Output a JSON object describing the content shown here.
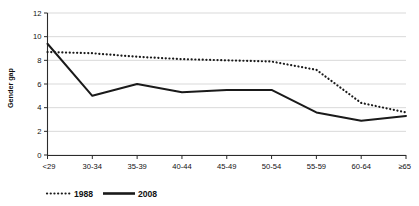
{
  "chart_data": {
    "type": "line",
    "title": "",
    "xlabel": "",
    "ylabel": "Gender gap",
    "categories": [
      "<29",
      "30-34",
      "35-39",
      "40-44",
      "45-49",
      "50-54",
      "55-59",
      "60-64",
      "≥65"
    ],
    "series": [
      {
        "name": "1988",
        "style": "dotted",
        "color": "#1a1a1a",
        "values": [
          8.7,
          8.6,
          8.3,
          8.1,
          8.0,
          7.9,
          7.2,
          4.4,
          3.6
        ]
      },
      {
        "name": "2008",
        "style": "solid",
        "color": "#1a1a1a",
        "values": [
          9.4,
          5.0,
          6.0,
          5.3,
          5.5,
          5.5,
          3.6,
          2.9,
          3.3
        ]
      }
    ],
    "ylim": [
      0,
      12
    ],
    "yticks": [
      0,
      2,
      4,
      6,
      8,
      10,
      12
    ],
    "ytick_labels": [
      "0",
      "2",
      "4",
      "6",
      "8",
      "10",
      "12"
    ],
    "grid": true,
    "grid_axis": "y",
    "legend_position": "bottom",
    "legend_entries": [
      "1988",
      "2008"
    ]
  },
  "axes": {
    "y_axis_title": "Gender gap"
  }
}
